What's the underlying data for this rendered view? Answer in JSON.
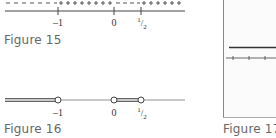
{
  "figures": [
    {
      "id": "figure-15",
      "caption": "Figure 15",
      "type": "sign-chart",
      "signs": [
        {
          "from": "-inf",
          "to": "-1",
          "sign": "-",
          "glyphs": "– – – – – – –"
        },
        {
          "from": "-1",
          "to": "0",
          "sign": "+",
          "glyphs": "+ + + + + + + +"
        },
        {
          "from": "0",
          "to": "1/2",
          "sign": "-",
          "glyphs": "– – – –"
        },
        {
          "from": "1/2",
          "to": "inf",
          "sign": "+",
          "glyphs": "+ + + + + +"
        }
      ],
      "ticks": [
        {
          "value": -1,
          "label": "–1"
        },
        {
          "value": 0,
          "label": "0"
        },
        {
          "value": 0.5,
          "label": "1/2",
          "num": "1",
          "den": "2"
        }
      ]
    },
    {
      "id": "figure-16",
      "caption": "Figure 16",
      "type": "solution-set",
      "intervals": [
        {
          "from": "-inf",
          "to": "-1",
          "left_closed": false,
          "right_closed": false
        },
        {
          "from": "0",
          "to": "1/2",
          "left_closed": false,
          "right_closed": false
        }
      ],
      "ticks": [
        {
          "value": -1,
          "label": "–1"
        },
        {
          "value": 0,
          "label": "0"
        },
        {
          "value": 0.5,
          "label": "1/2",
          "num": "1",
          "den": "2"
        }
      ]
    },
    {
      "id": "figure-17",
      "caption": "Figure 17",
      "type": "graph-partial"
    }
  ]
}
